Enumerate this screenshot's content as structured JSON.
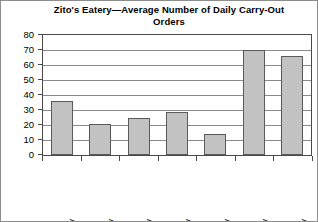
{
  "chart_data": {
    "type": "bar",
    "title": "Zito's Eatery—Average Number of Daily Carry-Out Orders",
    "title_line1": "Zito's Eatery—Average Number of Daily Carry-Out",
    "title_line2": "Orders",
    "xlabel": "",
    "ylabel": "",
    "categories": [
      "Sunday",
      "Monday",
      "Tuesday",
      "Wednesday",
      "Thursday",
      "Friday",
      "Saturday"
    ],
    "values": [
      36,
      21,
      25,
      29,
      14,
      70,
      66
    ],
    "ylim": [
      0,
      80
    ],
    "ytick_labels": [
      "80",
      "70",
      "60",
      "50",
      "40",
      "30",
      "20",
      "10",
      "0"
    ],
    "ytick_values": [
      80,
      70,
      60,
      50,
      40,
      30,
      20,
      10,
      0
    ],
    "ytick_step": 10,
    "grid": true,
    "grid_axis": "y",
    "legend": false,
    "legend_position": "none",
    "bar_fill_color": "#c2c2c2",
    "bar_border_color": "#5a5a5a",
    "grid_color": "#8a8a8a",
    "axis_color": "#4a4a4a",
    "text_color": "#000000",
    "background_color": "#ffffff",
    "xtick_label_rotation": -90
  }
}
